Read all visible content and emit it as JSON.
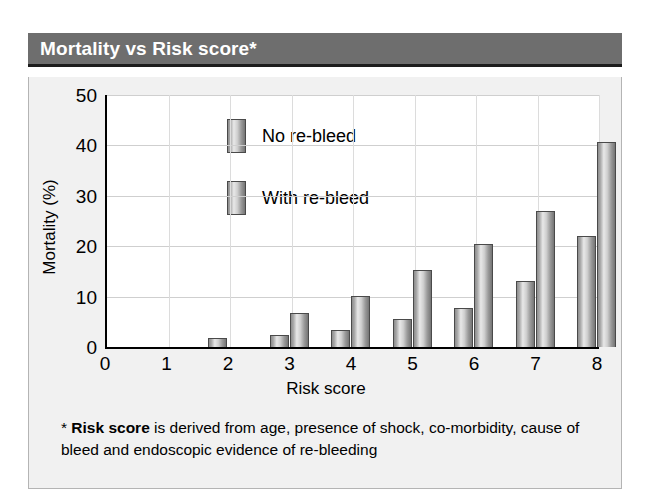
{
  "header": {
    "title": "Mortality vs Risk score*"
  },
  "footnote": {
    "marker": "*",
    "bold_term": "Risk score",
    "rest_line1": " is derived from age, presence of shock, co-morbidity,",
    "line2": "cause of bleed and endoscopic evidence of re-bleeding"
  },
  "colors": {
    "header_bg": "#6e6e6e",
    "header_text": "#ffffff",
    "panel_bg": "#f1f1f1",
    "plot_bg": "#ffffff",
    "axis": "#000000",
    "grid": "#cfcfcf",
    "bar_edge": "#4a4a4a",
    "bar_light": "#e8e8e8",
    "bar_dark": "#757575"
  },
  "chart_data": {
    "type": "bar",
    "title": "Mortality vs Risk score*",
    "xlabel": "Risk score",
    "ylabel": "Mortality (%)",
    "categories": [
      "0",
      "1",
      "2",
      "3",
      "4",
      "5",
      "6",
      "7",
      "8"
    ],
    "series": [
      {
        "name": "No re-bleed",
        "values": [
          0,
          0,
          1.8,
          2.3,
          3.3,
          5.6,
          7.7,
          13.1,
          22.0
        ]
      },
      {
        "name": "With re-bleed",
        "values": [
          0,
          0,
          0,
          6.8,
          10.1,
          15.3,
          20.4,
          26.9,
          40.7
        ]
      }
    ],
    "ylim": [
      0,
      50
    ],
    "yticks": [
      0,
      10,
      20,
      30,
      40,
      50
    ],
    "xticks": [
      0,
      1,
      2,
      3,
      4,
      5,
      6,
      7,
      8
    ],
    "grid": true,
    "legend": "inside-top-left"
  }
}
